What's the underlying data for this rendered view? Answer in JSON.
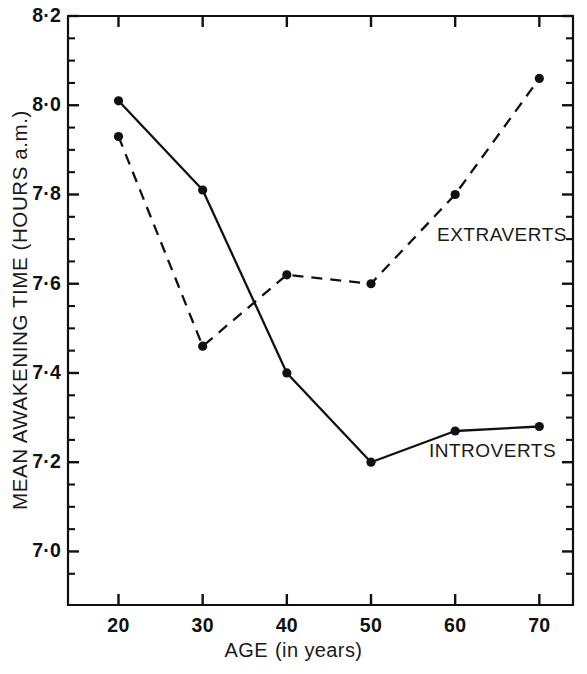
{
  "chart_data": {
    "type": "line",
    "title": "",
    "xlabel": "AGE  (in years)",
    "ylabel": "MEAN AWAKENING TIME (HOURS a.m.)",
    "x": [
      20,
      30,
      40,
      50,
      60,
      70
    ],
    "xlim": [
      14,
      74
    ],
    "ylim": [
      6.88,
      8.2
    ],
    "grid": false,
    "legend_position": "inline-annotations",
    "x_tick_labels": [
      "20",
      "30",
      "40",
      "50",
      "60",
      "70"
    ],
    "y_tick_labels": [
      "8·2",
      "8·0",
      "7·8",
      "7·6",
      "7·4",
      "7·2",
      "7·0"
    ],
    "y_tick_values": [
      8.2,
      8.0,
      7.8,
      7.6,
      7.4,
      7.2,
      7.0
    ],
    "y_minor_tick_values": [
      8.15,
      8.1,
      8.05,
      7.95,
      7.9,
      7.85,
      7.75,
      7.7,
      7.65,
      7.55,
      7.5,
      7.45,
      7.35,
      7.3,
      7.25,
      7.15,
      7.1,
      7.05,
      6.95
    ],
    "series": [
      {
        "name": "INTROVERTS",
        "style": "solid",
        "marker": "filled-circle",
        "color": "#111111",
        "values": [
          8.01,
          7.81,
          7.4,
          7.2,
          7.27,
          7.28
        ]
      },
      {
        "name": "EXTRAVERTS",
        "style": "dashed",
        "marker": "filled-circle",
        "color": "#111111",
        "values": [
          7.93,
          7.46,
          7.62,
          7.6,
          7.8,
          8.06
        ]
      }
    ],
    "annotations": [
      {
        "text": "EXTRAVERTS",
        "x": 60,
        "y": 7.7
      },
      {
        "text": "INTROVERTS",
        "x": 60,
        "y": 7.25
      }
    ]
  },
  "axes": {
    "y_title": "MEAN AWAKENING TIME (HOURS a.m.)",
    "x_title_main": "AGE",
    "x_title_paren": "(in years)"
  },
  "ticks": {
    "x": [
      {
        "label": "20"
      },
      {
        "label": "30"
      },
      {
        "label": "40"
      },
      {
        "label": "50"
      },
      {
        "label": "60"
      },
      {
        "label": "70"
      }
    ],
    "y": [
      {
        "label": "8·2"
      },
      {
        "label": "8·0"
      },
      {
        "label": "7·8"
      },
      {
        "label": "7·6"
      },
      {
        "label": "7·4"
      },
      {
        "label": "7·2"
      },
      {
        "label": "7·0"
      }
    ]
  },
  "labels": {
    "extraverts": "EXTRAVERTS",
    "introverts": "INTROVERTS"
  },
  "colors": {
    "ink": "#111111",
    "background": "#ffffff"
  }
}
